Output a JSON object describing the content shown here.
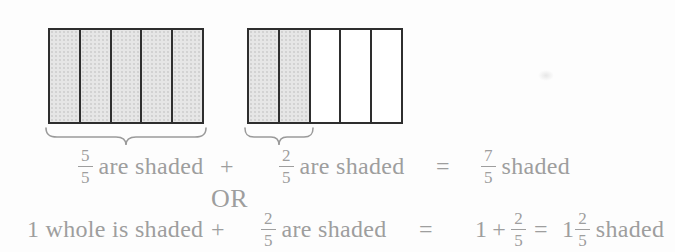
{
  "figure": {
    "bar1": {
      "total": 5,
      "shaded": 5
    },
    "bar2": {
      "total": 5,
      "shaded": 2
    },
    "colors": {
      "shade_fill": "#e6e6e6",
      "bar_border": "#2e2e2e",
      "text_gray": "#9e9e9e",
      "brace_gray": "#9a9a9a"
    }
  },
  "equation_row1": {
    "frac1": {
      "num": "5",
      "den": "5"
    },
    "label1": "are shaded",
    "plus": "+",
    "frac2": {
      "num": "2",
      "den": "5"
    },
    "label2": "are shaded",
    "equals": "=",
    "frac3": {
      "num": "7",
      "den": "5"
    },
    "label3": "shaded"
  },
  "or_label": "OR",
  "equation_row2": {
    "label1": "1 whole is shaded",
    "plus1": "+",
    "frac1": {
      "num": "2",
      "den": "5"
    },
    "label2": "are shaded",
    "equals1": "=",
    "sum_whole": "1",
    "sum_plus": "+",
    "frac2": {
      "num": "2",
      "den": "5"
    },
    "equals2": "=",
    "mixed_whole": "1",
    "frac3": {
      "num": "2",
      "den": "5"
    },
    "label3": "shaded"
  }
}
